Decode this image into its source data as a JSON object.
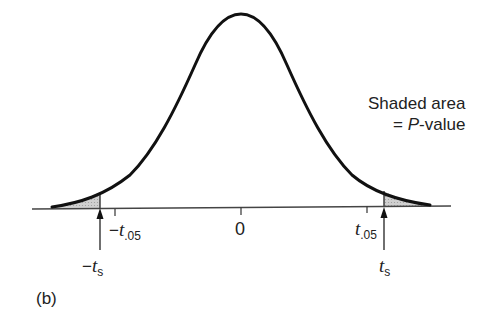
{
  "figure": {
    "panel_label": "(b)",
    "annotation": {
      "line1": "Shaded area",
      "line2_prefix": "= ",
      "line2_italic": "P",
      "line2_suffix": "-value"
    },
    "axis_labels": {
      "neg_t05": {
        "sign": "−",
        "var": "t",
        "sub": ".05"
      },
      "zero": "0",
      "pos_t05": {
        "var": "t",
        "sub": ".05"
      },
      "neg_ts": {
        "sign": "−",
        "var": "t",
        "sub": "s"
      },
      "pos_ts": {
        "var": "t",
        "sub": "s"
      }
    },
    "colors": {
      "curve": "#111111",
      "axis": "#333333",
      "shade": "#c8c8c8"
    }
  }
}
